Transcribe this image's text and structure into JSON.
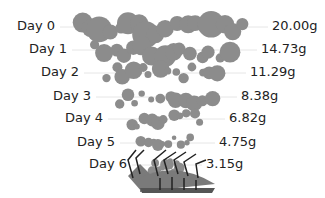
{
  "chart_data": {
    "type": "scatter",
    "title": "",
    "xlabel": "",
    "ylabel": "",
    "categories": [
      "Day 0",
      "Day 1",
      "Day 2",
      "Day 3",
      "Day 4",
      "Day 5",
      "Day 6"
    ],
    "values": [
      20.0,
      14.73,
      11.29,
      8.38,
      6.82,
      4.75,
      3.15
    ],
    "value_labels": [
      "20.00g",
      "14.73g",
      "11.29g",
      "8.38g",
      "6.82g",
      "4.75g",
      "3.15g"
    ],
    "unit": "g",
    "grid": true,
    "legend": null,
    "annotations": [
      "bug illustration at bottom"
    ]
  },
  "colors": {
    "bubble": "#8c8c8c",
    "gridline": "#e6e6e6",
    "text": "#222222",
    "bug_dark": "#555555",
    "bug_mid": "#7a7a7a"
  },
  "rows": [
    {
      "label": "Day 0",
      "value": "20.00g"
    },
    {
      "label": "Day 1",
      "value": "14.73g"
    },
    {
      "label": "Day 2",
      "value": "11.29g"
    },
    {
      "label": "Day 3",
      "value": "8.38g"
    },
    {
      "label": "Day 4",
      "value": "6.82g"
    },
    {
      "label": "Day 5",
      "value": "4.75g"
    },
    {
      "label": "Day 6",
      "value": "3.15g"
    }
  ]
}
